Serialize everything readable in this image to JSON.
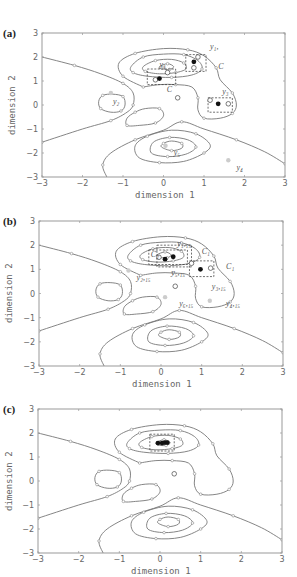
{
  "figure": {
    "axes": {
      "xlabel": "dimension 1",
      "ylabel": "dimension 2",
      "xlim": [
        -3,
        3
      ],
      "ylim": [
        -3,
        3
      ],
      "xticks": [
        -3,
        -2,
        -1,
        0,
        1,
        2,
        3
      ],
      "yticks": [
        -3,
        -2,
        -1,
        0,
        1,
        2,
        3
      ],
      "xtick_labels": [
        "-3",
        "-2",
        "-1",
        "0",
        "1",
        "2",
        "3"
      ],
      "ytick_labels": [
        "-3",
        "-2",
        "-1",
        "0",
        "1",
        "2",
        "3"
      ]
    },
    "colors": {
      "contour": "#777777",
      "frame": "#999999",
      "filled_point": "#111111",
      "grey_point": "#cccccc"
    },
    "panels": [
      {
        "id": "a",
        "label": "(a)",
        "frame": {
          "left": 42,
          "top": 33,
          "right": 285,
          "bottom": 177
        },
        "label_pos": {
          "x": 3,
          "y": 27
        },
        "xlabel_pos": {
          "x": 135,
          "y": 190
        },
        "ylabel_pos": {
          "x": 7,
          "y": 135
        },
        "boxes": [
          {
            "x0": -0.4,
            "y0": 0.85,
            "x1": 0.3,
            "y1": 1.5
          },
          {
            "x0": 0.55,
            "y0": 1.4,
            "x1": 1.05,
            "y1": 2.1
          },
          {
            "x0": 1.1,
            "y0": -0.3,
            "x1": 1.7,
            "y1": 0.3
          }
        ],
        "points_filled": [
          [
            -0.1,
            1.1
          ],
          [
            0.75,
            1.8
          ],
          [
            1.35,
            0.05
          ]
        ],
        "points_open": [
          [
            -0.2,
            1.05
          ],
          [
            0.1,
            1.35
          ],
          [
            0.85,
            2.0
          ],
          [
            0.75,
            1.55
          ],
          [
            1.15,
            0.2
          ],
          [
            1.6,
            0.05
          ],
          [
            0.35,
            0.3
          ]
        ],
        "points_grey": [
          [
            -1.3,
            0.5
          ],
          [
            0.05,
            -1.7
          ],
          [
            1.6,
            -2.3
          ],
          [
            0.0,
            1.55
          ]
        ],
        "annotations": [
          {
            "text": "y₁",
            "x": -0.1,
            "y": 1.6
          },
          {
            "text": "y₁,",
            "x": 1.15,
            "y": 2.35
          },
          {
            "text": "C",
            "x": 1.35,
            "y": 1.5
          },
          {
            "text": "C",
            "x": 0.08,
            "y": 0.55
          },
          {
            "text": "y₂",
            "x": -1.25,
            "y": 0.05
          },
          {
            "text": "y₃",
            "x": 1.45,
            "y": 0.45
          },
          {
            "text": "y₅",
            "x": 0.25,
            "y": -2.1
          },
          {
            "text": "y₄",
            "x": 1.8,
            "y": -2.7
          }
        ]
      },
      {
        "id": "b",
        "label": "(b)",
        "frame": {
          "left": 39,
          "top": 221,
          "right": 283,
          "bottom": 366
        },
        "label_pos": {
          "x": 3,
          "y": 215
        },
        "xlabel_pos": {
          "x": 132,
          "y": 379
        },
        "ylabel_pos": {
          "x": 4,
          "y": 323
        },
        "boxes": [
          {
            "x0": -0.3,
            "y0": 1.2,
            "x1": 0.65,
            "y1": 1.8
          },
          {
            "x0": -0.1,
            "y0": 1.1,
            "x1": 0.75,
            "y1": 2.0
          },
          {
            "x0": 0.7,
            "y0": 0.7,
            "x1": 1.3,
            "y1": 1.35
          }
        ],
        "points_filled": [
          [
            0.1,
            1.42
          ],
          [
            0.3,
            1.52
          ],
          [
            0.97,
            1.0
          ]
        ],
        "points_open": [
          [
            -0.05,
            1.5
          ],
          [
            0.75,
            1.25
          ],
          [
            1.22,
            1.05
          ],
          [
            0.35,
            0.3
          ]
        ],
        "points_grey": [
          [
            -0.8,
            0.95
          ],
          [
            0.1,
            -0.15
          ],
          [
            1.2,
            -0.3
          ]
        ],
        "annotations": [
          {
            "text": "y₁,₁₅",
            "x": 0.4,
            "y": 1.95
          },
          {
            "text": "C₂",
            "x": -0.25,
            "y": 1.5
          },
          {
            "text": "C₁",
            "x": 1.0,
            "y": 1.65
          },
          {
            "text": "C₁",
            "x": 1.6,
            "y": 1.0
          },
          {
            "text": "y₅,₁₅",
            "x": 0.25,
            "y": 0.75
          },
          {
            "text": "y₂,₁₅",
            "x": -0.6,
            "y": 0.55
          },
          {
            "text": "y₃,₁₅",
            "x": 1.25,
            "y": 0.2
          },
          {
            "text": "y₆,₁₅",
            "x": 0.45,
            "y": -0.5
          },
          {
            "text": "y₄,₁₅",
            "x": 1.6,
            "y": -0.5
          }
        ]
      },
      {
        "id": "c",
        "label": "(c)",
        "frame": {
          "left": 38,
          "top": 409,
          "right": 282,
          "bottom": 553
        },
        "label_pos": {
          "x": 3,
          "y": 403
        },
        "xlabel_pos": {
          "x": 131,
          "y": 566
        },
        "ylabel_pos": {
          "x": 4,
          "y": 511
        },
        "boxes": [
          {
            "x0": -0.25,
            "y0": 1.25,
            "x1": 0.35,
            "y1": 1.95
          }
        ],
        "points_filled": [
          [
            -0.05,
            1.58
          ],
          [
            0.05,
            1.58
          ],
          [
            0.12,
            1.6
          ],
          [
            0.18,
            1.6
          ]
        ],
        "points_open": [
          [
            0.35,
            0.3
          ]
        ],
        "points_grey": [],
        "annotations": []
      }
    ],
    "contours": [
      {
        "name": "outer-left-boundary",
        "closed": false,
        "pts": [
          [
            -3,
            2.0
          ],
          [
            -2.2,
            1.65
          ],
          [
            -1.55,
            1.3
          ],
          [
            -1.0,
            0.9
          ],
          [
            -0.75,
            0.5
          ],
          [
            -0.75,
            0.0
          ],
          [
            -0.9,
            -0.3
          ],
          [
            -1.3,
            -0.65
          ],
          [
            -2.0,
            -1.0
          ],
          [
            -3,
            -1.55
          ]
        ]
      },
      {
        "name": "left-island",
        "closed": true,
        "pts": [
          [
            -1.25,
            0.45
          ],
          [
            -1.0,
            0.35
          ],
          [
            -0.95,
            0.0
          ],
          [
            -1.05,
            -0.25
          ],
          [
            -1.3,
            -0.3
          ],
          [
            -1.55,
            -0.15
          ],
          [
            -1.6,
            0.15
          ],
          [
            -1.5,
            0.4
          ]
        ]
      },
      {
        "name": "center-left-island",
        "closed": true,
        "pts": [
          [
            -0.45,
            -0.15
          ],
          [
            -0.1,
            -0.15
          ],
          [
            0.0,
            -0.45
          ],
          [
            -0.2,
            -0.75
          ],
          [
            -0.6,
            -0.85
          ],
          [
            -0.9,
            -0.85
          ],
          [
            -0.9,
            -0.55
          ],
          [
            -0.7,
            -0.3
          ]
        ]
      },
      {
        "name": "upper-outer",
        "closed": false,
        "pts": [
          [
            -0.5,
            0.75
          ],
          [
            -1.0,
            1.2
          ],
          [
            -1.1,
            1.75
          ],
          [
            -0.7,
            2.15
          ],
          [
            0.0,
            2.35
          ],
          [
            0.6,
            2.3
          ],
          [
            1.0,
            2.05
          ],
          [
            1.3,
            1.55
          ],
          [
            1.4,
            1.05
          ],
          [
            1.7,
            0.5
          ],
          [
            1.8,
            0.0
          ],
          [
            1.7,
            -0.35
          ],
          [
            1.4,
            -0.55
          ],
          [
            1.0,
            -0.55
          ],
          [
            0.85,
            -0.2
          ],
          [
            0.85,
            0.3
          ],
          [
            0.7,
            0.75
          ],
          [
            0.3,
            0.85
          ],
          [
            -0.1,
            0.85
          ],
          [
            -0.5,
            0.75
          ]
        ]
      },
      {
        "name": "upper-mid",
        "closed": true,
        "pts": [
          [
            -0.8,
            1.6
          ],
          [
            -0.5,
            2.0
          ],
          [
            0.0,
            2.12
          ],
          [
            0.5,
            2.1
          ],
          [
            0.85,
            1.85
          ],
          [
            0.95,
            1.5
          ],
          [
            0.7,
            1.25
          ],
          [
            0.2,
            1.15
          ],
          [
            -0.4,
            1.2
          ],
          [
            -0.75,
            1.35
          ]
        ]
      },
      {
        "name": "upper-inner",
        "closed": true,
        "pts": [
          [
            -0.5,
            1.6
          ],
          [
            -0.2,
            1.85
          ],
          [
            0.2,
            1.9
          ],
          [
            0.5,
            1.75
          ],
          [
            0.55,
            1.5
          ],
          [
            0.3,
            1.35
          ],
          [
            -0.1,
            1.3
          ],
          [
            -0.45,
            1.4
          ]
        ]
      },
      {
        "name": "upper-core",
        "closed": true,
        "pts": [
          [
            -0.1,
            1.6
          ],
          [
            0.1,
            1.72
          ],
          [
            0.25,
            1.6
          ],
          [
            0.15,
            1.48
          ],
          [
            -0.05,
            1.5
          ]
        ]
      },
      {
        "name": "lower-boundary",
        "closed": false,
        "pts": [
          [
            -1.4,
            -3.0
          ],
          [
            -1.5,
            -2.5
          ],
          [
            -1.3,
            -2.0
          ],
          [
            -0.7,
            -1.45
          ],
          [
            0.0,
            -1.05
          ],
          [
            0.45,
            -0.7
          ],
          [
            1.0,
            -1.0
          ],
          [
            1.8,
            -1.45
          ],
          [
            2.5,
            -1.95
          ],
          [
            3.0,
            -2.45
          ]
        ]
      },
      {
        "name": "lower-outer",
        "closed": true,
        "pts": [
          [
            -0.6,
            -2.2
          ],
          [
            -0.1,
            -2.4
          ],
          [
            0.5,
            -2.35
          ],
          [
            1.0,
            -2.0
          ],
          [
            1.15,
            -1.65
          ],
          [
            0.8,
            -1.2
          ],
          [
            0.2,
            -1.05
          ],
          [
            -0.4,
            -1.3
          ],
          [
            -0.7,
            -1.7
          ]
        ]
      },
      {
        "name": "lower-mid",
        "closed": true,
        "pts": [
          [
            -0.3,
            -2.0
          ],
          [
            0.1,
            -2.15
          ],
          [
            0.55,
            -2.05
          ],
          [
            0.8,
            -1.75
          ],
          [
            0.6,
            -1.45
          ],
          [
            0.15,
            -1.35
          ],
          [
            -0.25,
            -1.55
          ]
        ]
      },
      {
        "name": "lower-inner",
        "closed": true,
        "pts": [
          [
            -0.05,
            -1.75
          ],
          [
            0.2,
            -1.9
          ],
          [
            0.45,
            -1.8
          ],
          [
            0.45,
            -1.6
          ],
          [
            0.2,
            -1.5
          ],
          [
            0.0,
            -1.6
          ]
        ]
      }
    ]
  }
}
